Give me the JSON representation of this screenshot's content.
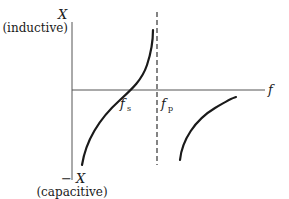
{
  "diagram": {
    "y_axis": {
      "top_label": "X",
      "top_sublabel": "(inductive)",
      "bottom_label": "− X",
      "bottom_sublabel": "(capacitive)"
    },
    "x_axis": {
      "label": "f"
    },
    "markers": {
      "series_resonance": {
        "symbol": "f",
        "subscript": "s"
      },
      "parallel_resonance": {
        "symbol": "f",
        "subscript": "p"
      }
    },
    "colors": {
      "line": "#1a1a1a",
      "axis": "#555555"
    }
  }
}
